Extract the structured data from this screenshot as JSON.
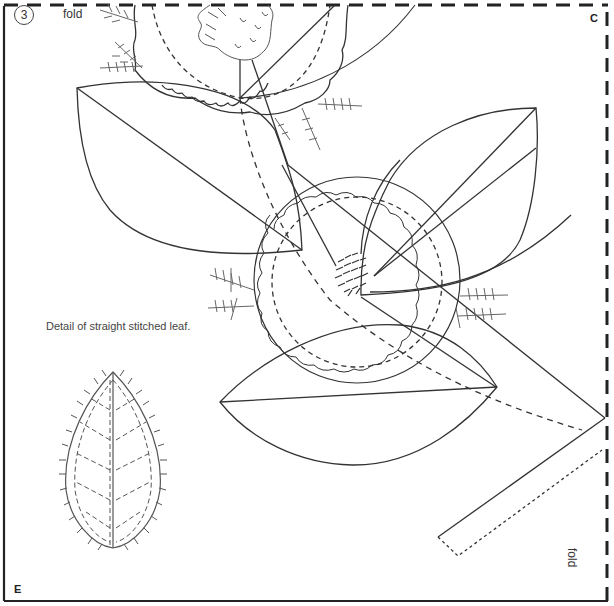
{
  "page": {
    "step_number": "3",
    "labels": {
      "fold_top": "fold",
      "fold_right": "fold",
      "corner_top_right": "C",
      "corner_bottom_left": "E"
    },
    "caption": "Detail of straight stitched leaf."
  },
  "pattern": {
    "type": "embroidery transfer pattern",
    "elements": [
      "partial-scalloped-flower-top",
      "scalloped-flower-center",
      "leaf-top-left",
      "leaf-right",
      "leaf-bottom",
      "stem-ribbon",
      "fern-sprigs",
      "detail-leaf-straight-stitch"
    ],
    "line_color": "#333333",
    "fold_line_color": "#222222"
  }
}
